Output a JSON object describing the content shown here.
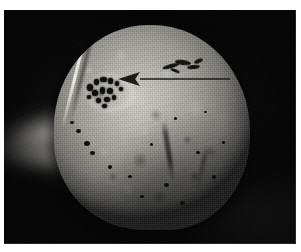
{
  "figure": {
    "caption": "",
    "media_type": "photograph",
    "subject": "bone specimen",
    "description": "Grayscale close-up photograph of a rounded bone specimen against a black background, with a drawn arrow indicating a cluster of dark erosive pits on the upper-left surface.",
    "plate": {
      "background_color": "#040404",
      "margin_color": "#ffffff"
    }
  },
  "specimen": {
    "name": "bone-specimen",
    "label": "",
    "surface_color_light": "#d9d7d0",
    "surface_color_mid": "#a3a19b",
    "surface_color_dark": "#4a4947",
    "features": [
      {
        "name": "lesion-cluster",
        "label": "",
        "type": "erosive-pit-cluster",
        "pit_count": 14,
        "color": "#0c0c0b"
      },
      {
        "name": "lesion-secondary",
        "label": "",
        "type": "dark-streak-lesion",
        "streak_count": 5,
        "color": "#101010"
      },
      {
        "name": "ridge-line",
        "label": "",
        "type": "surface-ridge"
      },
      {
        "name": "bone-process",
        "label": "",
        "type": "out-of-focus-process"
      },
      {
        "name": "fissure",
        "label": "",
        "type": "surface-fissure"
      }
    ],
    "foramina_count": 15
  },
  "annotation": {
    "arrow": {
      "name": "pointer-arrow",
      "label": "",
      "color": "#1a1a1a",
      "points_to": "lesion-cluster",
      "tip_x": 114,
      "tip_y": 69,
      "tail_x": 226,
      "tail_y": 69,
      "head_length": 22,
      "head_half_width": 7,
      "shaft_thickness": 1.6
    }
  }
}
